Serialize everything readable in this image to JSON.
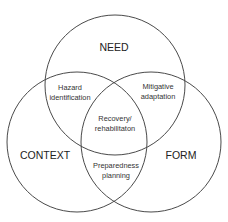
{
  "diagram": {
    "type": "venn",
    "colors": {
      "stroke": "#4a4a4a",
      "text": "#222222",
      "background": "#ffffff"
    },
    "sets": [
      {
        "id": "need",
        "label": "NEED",
        "cx": 115,
        "cy": 85,
        "r": 70,
        "label_x": 114,
        "label_y": 51
      },
      {
        "id": "context",
        "label": "CONTEXT",
        "cx": 77,
        "cy": 142,
        "r": 70,
        "label_x": 45,
        "label_y": 159
      },
      {
        "id": "form",
        "label": "FORM",
        "cx": 151,
        "cy": 142,
        "r": 70,
        "label_x": 181,
        "label_y": 159
      }
    ],
    "intersections": [
      {
        "id": "need-context",
        "lines": [
          "Hazard",
          "identification"
        ],
        "x": 70,
        "y1": 90,
        "y2": 100
      },
      {
        "id": "need-form",
        "lines": [
          "Mitigative",
          "adaptation"
        ],
        "x": 158,
        "y1": 89,
        "y2": 99
      },
      {
        "id": "all",
        "lines": [
          "Recovery/",
          "rehabilitaton"
        ],
        "x": 115,
        "y1": 121,
        "y2": 131
      },
      {
        "id": "context-form",
        "lines": [
          "Preparedness",
          "planning"
        ],
        "x": 116,
        "y1": 168,
        "y2": 178
      }
    ]
  }
}
